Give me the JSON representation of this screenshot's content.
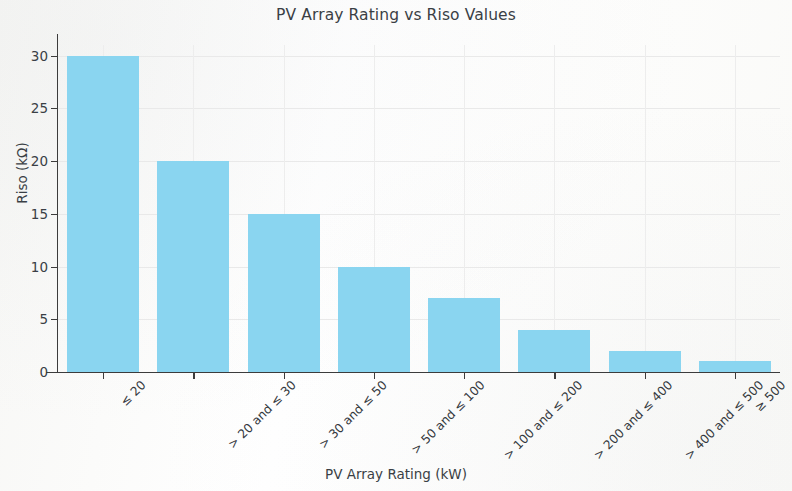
{
  "chart_data": {
    "type": "bar",
    "title": "PV Array Rating vs Riso Values",
    "xlabel": "PV Array Rating (kW)",
    "ylabel": "Riso (kΩ)",
    "categories": [
      "≤ 20",
      "> 20 and ≤ 30",
      "> 30 and ≤ 50",
      "> 50 and ≤ 100",
      "> 100 and ≤ 200",
      "> 200 and ≤ 400",
      "> 400 and ≤ 500",
      "≥ 500"
    ],
    "values": [
      30,
      20,
      15,
      10,
      7,
      4,
      2,
      1
    ],
    "ylim": [
      0,
      31
    ],
    "yticks": [
      0,
      5,
      10,
      15,
      20,
      25,
      30
    ],
    "ytick_labels": [
      "0",
      "5",
      "10",
      "15",
      "20",
      "25",
      "30"
    ],
    "grid": true,
    "legend": null,
    "bar_color": "#8ad5f0",
    "background_color": "#ffffff",
    "text_color": "#3a3f45"
  }
}
